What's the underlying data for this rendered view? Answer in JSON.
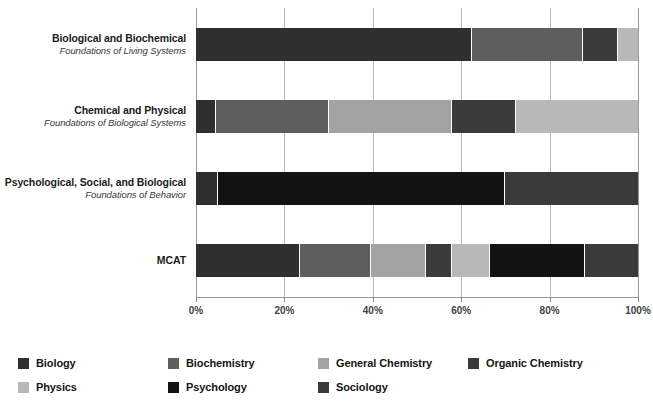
{
  "chart_data": {
    "type": "bar",
    "orientation": "horizontal",
    "stacked": true,
    "normalized_percent": true,
    "title": "",
    "xlabel": "",
    "ylabel": "",
    "xlim": [
      0,
      100
    ],
    "xticks": [
      0,
      20,
      40,
      60,
      80,
      100
    ],
    "xtick_labels": [
      "0%",
      "20%",
      "40%",
      "60%",
      "80%",
      "100%"
    ],
    "grid": "vertical",
    "legend_position": "bottom",
    "categories": [
      "Biological and Biochemical",
      "Chemical and Physical",
      "Psychological, Social, and Biological",
      "MCAT"
    ],
    "category_sublabels": [
      "Foundations of Living Systems",
      "Foundations of Biological Systems",
      "Foundations of Behavior",
      ""
    ],
    "series": [
      {
        "name": "Biology",
        "color": "#2f2f2f",
        "values": [
          62.5,
          4.5,
          5.0,
          23.5
        ]
      },
      {
        "name": "Biochemistry",
        "color": "#5e5e5e",
        "values": [
          25.0,
          25.5,
          0.0,
          16.0
        ]
      },
      {
        "name": "General Chemistry",
        "color": "#a3a3a3",
        "values": [
          0.0,
          28.0,
          0.0,
          12.5
        ]
      },
      {
        "name": "Organic Chemistry",
        "color": "#3b3b3b",
        "values": [
          8.0,
          14.5,
          0.0,
          6.0
        ]
      },
      {
        "name": "Physics",
        "color": "#b8b8b8",
        "values": [
          4.5,
          27.5,
          0.0,
          8.5
        ]
      },
      {
        "name": "Psychology",
        "color": "#121212",
        "values": [
          0.0,
          0.0,
          65.0,
          21.5
        ]
      },
      {
        "name": "Sociology",
        "color": "#3a3a3a",
        "values": [
          0.0,
          0.0,
          30.0,
          12.0
        ]
      }
    ]
  },
  "legend": {
    "items": [
      {
        "label": "Biology",
        "color": "#2f2f2f"
      },
      {
        "label": "Biochemistry",
        "color": "#5e5e5e"
      },
      {
        "label": "General Chemistry",
        "color": "#a3a3a3"
      },
      {
        "label": "Organic Chemistry",
        "color": "#3b3b3b"
      },
      {
        "label": "Physics",
        "color": "#b8b8b8"
      },
      {
        "label": "Psychology",
        "color": "#121212"
      },
      {
        "label": "Sociology",
        "color": "#3a3a3a"
      }
    ]
  },
  "colors": {
    "background": "#ffffff",
    "gridline": "#b9b9b9",
    "axis": "#9a9a9a",
    "tick_label": "#3f3f3f",
    "category_label": "#1c1c1c",
    "category_sublabel": "#3a3a3a"
  }
}
